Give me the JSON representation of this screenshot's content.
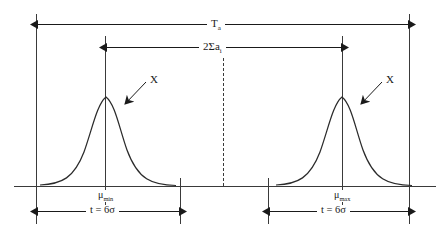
{
  "diagram": {
    "title_label": "T",
    "title_sub": "a",
    "span_label": "2Σa",
    "span_sub": "i",
    "center_divider": "dashed-centerline",
    "distributions": [
      {
        "name": "left",
        "mean_label": "μ",
        "mean_sub": "min",
        "curve_label": "X",
        "width_label": "t = 6σ"
      },
      {
        "name": "right",
        "mean_label": "μ",
        "mean_sub": "max",
        "curve_label": "X",
        "width_label": "t = 6σ"
      }
    ],
    "colors": {
      "line": "#1a1a1a",
      "curve": "#2b2b2b",
      "background": "#ffffff"
    }
  }
}
